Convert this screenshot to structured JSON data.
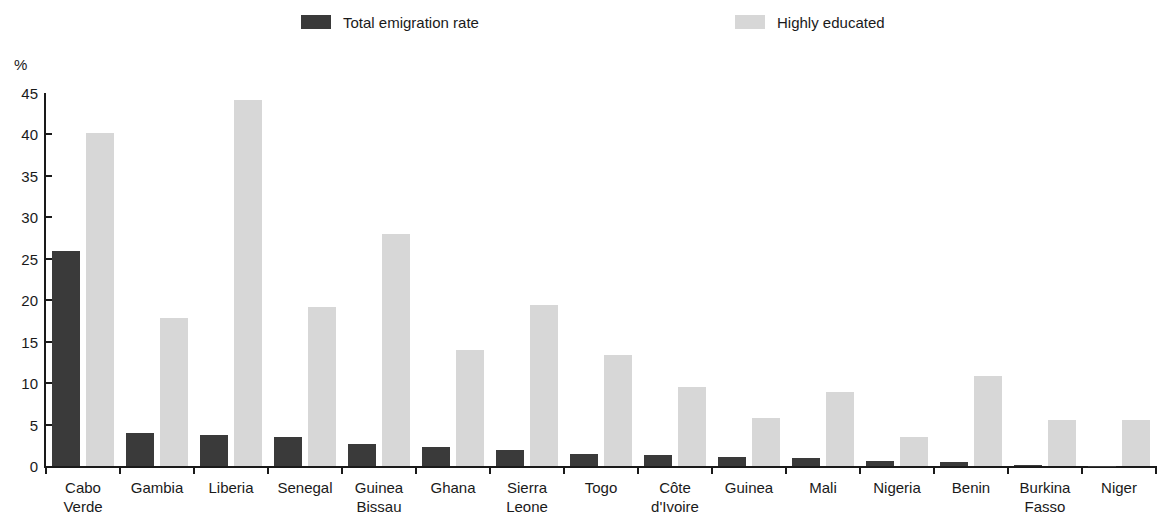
{
  "legend": {
    "items": [
      {
        "label": "Total emigration rate",
        "color": "#3a3a3a",
        "key": "total"
      },
      {
        "label": "Highly educated",
        "color": "#d7d7d7",
        "key": "highly"
      }
    ]
  },
  "axis": {
    "y_unit": "%",
    "y_ticks": [
      "45",
      "40",
      "35",
      "30",
      "25",
      "20",
      "15",
      "10",
      "5",
      "0"
    ]
  },
  "chart_data": {
    "type": "bar",
    "title": "",
    "xlabel": "",
    "ylabel": "%",
    "ylim": [
      0,
      45
    ],
    "ytick_step": 5,
    "grid": false,
    "legend_position": "top",
    "categories": [
      "Cabo\nVerde",
      "Gambia",
      "Liberia",
      "Senegal",
      "Guinea\nBissau",
      "Ghana",
      "Sierra\nLeone",
      "Togo",
      "Côte\nd'Ivoire",
      "Guinea",
      "Mali",
      "Nigeria",
      "Benin",
      "Burkina\nFasso",
      "Niger"
    ],
    "series": [
      {
        "name": "Total emigration rate",
        "color": "#3a3a3a",
        "values": [
          26.0,
          4.0,
          3.8,
          3.5,
          2.7,
          2.3,
          1.9,
          1.5,
          1.3,
          1.1,
          1.0,
          0.6,
          0.5,
          0.15,
          0.05
        ]
      },
      {
        "name": "Highly educated",
        "color": "#d7d7d7",
        "values": [
          40.2,
          17.8,
          44.2,
          19.2,
          28.0,
          14.0,
          19.4,
          13.4,
          9.5,
          5.8,
          8.9,
          3.5,
          10.9,
          5.6,
          5.5
        ]
      }
    ]
  }
}
